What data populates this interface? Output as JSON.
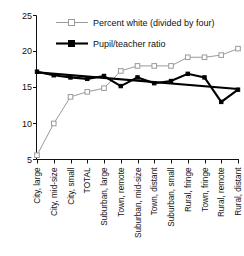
{
  "chart_data": {
    "type": "line",
    "title": "",
    "xlabel": "",
    "ylabel": "",
    "ylim": [
      5,
      25
    ],
    "yticks": [
      5,
      10,
      15,
      20,
      25
    ],
    "grid": false,
    "legend_position": "top-center",
    "categories": [
      "City, large",
      "City, mid-size",
      "City, small",
      "TOTAL",
      "Suburban, large",
      "Town, remote",
      "Suburban, mid-size",
      "Town, distant",
      "Suburban, small",
      "Rural, fringe",
      "Town, fringe",
      "Rural, remote",
      "Rural, distant"
    ],
    "series": [
      {
        "name": "Percent white (divided by four)",
        "color": "#9a9a9a",
        "marker": "open-square",
        "values": [
          5.6,
          10.0,
          13.7,
          14.4,
          14.9,
          17.3,
          18.0,
          18.0,
          18.0,
          19.2,
          19.2,
          19.5,
          20.4
        ]
      },
      {
        "name": "Pupil/teacher ratio",
        "color": "#000000",
        "marker": "filled-square",
        "values": [
          17.2,
          16.7,
          16.4,
          16.2,
          16.6,
          15.2,
          16.4,
          15.6,
          15.9,
          16.9,
          16.4,
          13.0,
          14.7
        ]
      }
    ],
    "trendline": {
      "name": "Pupil/teacher ratio trend",
      "color": "#000000",
      "start": 17.1,
      "end": 14.8
    }
  },
  "legend": {
    "items": [
      {
        "label": "Percent white (divided by four)",
        "marker": "open-square",
        "color": "#9a9a9a"
      },
      {
        "label": "Pupil/teacher ratio",
        "marker": "filled-square",
        "color": "#000000"
      }
    ]
  },
  "axis": {
    "y_tick_labels": [
      "25",
      "20",
      "15",
      "10",
      "5"
    ],
    "x_tick_labels": [
      "City, large",
      "City, mid-size",
      "City, small",
      "TOTAL",
      "Suburban, large",
      "Town, remote",
      "Suburban, mid-size",
      "Town, distant",
      "Suburban, small",
      "Rural, fringe",
      "Town, fringe",
      "Rural, remote",
      "Rural, distant"
    ]
  }
}
